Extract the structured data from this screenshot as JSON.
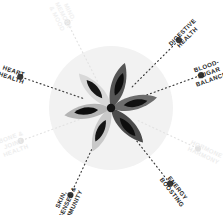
{
  "graphic": {
    "title": "Wellness Benefits Radial Wheel",
    "center": {
      "x": 111,
      "y": 108
    },
    "backdrop": {
      "name": "faint-circle-backdrop",
      "radius": 62,
      "color": "#f2f2f2"
    },
    "spoke": {
      "color": "#3a3a3a",
      "faded_color": "#e2e2e2",
      "inner_radius": 30,
      "outer_radius": 96,
      "dot_radius": 3.1,
      "dash": "1 3"
    },
    "benefits": [
      {
        "id": "digestive-health",
        "lines": [
          "DIGESTIVE",
          "HEALTH"
        ],
        "full_label": "DIGESTIVE HEALTH",
        "angle_deg": -45,
        "state": "active",
        "color": "#262626"
      },
      {
        "id": "blood-sugar-balance",
        "lines": [
          "BLOOD-",
          "SUGAR",
          "BALANCE"
        ],
        "full_label": "BLOOD-SUGAR BALANCE",
        "angle_deg": -20,
        "state": "active",
        "color": "#262626"
      },
      {
        "id": "hormone-harmony",
        "lines": [
          "HORMONE",
          "HARMONY"
        ],
        "full_label": "HORMONE HARMONY",
        "angle_deg": 25,
        "state": "faded",
        "color": "#ededed"
      },
      {
        "id": "energy-boosting",
        "lines": [
          "ENERGY",
          "BOOSTING"
        ],
        "full_label": "ENERGY BOOSTING",
        "angle_deg": 52,
        "state": "active",
        "color": "#262626"
      },
      {
        "id": "skin-senses-immunity",
        "lines": [
          "SKIN,",
          "SENSES &",
          "IMMUNITY"
        ],
        "full_label": "SKIN, SENSES & IMMUNITY",
        "angle_deg": 115,
        "state": "active",
        "color": "#262626"
      },
      {
        "id": "bone-joint-health",
        "lines": [
          "BONE &",
          "JOINT",
          "HEALTH"
        ],
        "full_label": "BONE & JOINT HEALTH",
        "angle_deg": 160,
        "state": "faded",
        "color": "#ededed"
      },
      {
        "id": "heart-health",
        "lines": [
          "HEART",
          "HEALTH"
        ],
        "full_label": "HEART HEALTH",
        "angle_deg": 199,
        "state": "active",
        "color": "#262626"
      },
      {
        "id": "mind-memory-mood",
        "lines": [
          "MIND,",
          "MEMORY",
          "& MOOD"
        ],
        "full_label": "MIND, MEMORY & MOOD",
        "angle_deg": 243,
        "state": "faded",
        "color": "#f0f0f0"
      }
    ],
    "flower": {
      "name": "six-petal-seed-flower",
      "hub_color": "#141414",
      "petals": [
        {
          "id": "petal-top",
          "rotation": -8,
          "petal_color": "#6d6d6d",
          "seed_color": "#101010"
        },
        {
          "id": "petal-upper-right",
          "rotation": 52,
          "petal_color": "#4b4b4b",
          "seed_color": "#0d0d0d"
        },
        {
          "id": "petal-lower-right",
          "rotation": 118,
          "petal_color": "#c9c9c9",
          "seed_color": "#141414"
        },
        {
          "id": "petal-bottom",
          "rotation": 176,
          "petal_color": "#b4b4b4",
          "seed_color": "#0d0d0d"
        },
        {
          "id": "petal-lower-left",
          "rotation": 232,
          "petal_color": "#d8d8d8",
          "seed_color": "#161616"
        },
        {
          "id": "petal-upper-left",
          "rotation": 292,
          "petal_color": "#555555",
          "seed_color": "#0d0d0d"
        }
      ]
    }
  }
}
